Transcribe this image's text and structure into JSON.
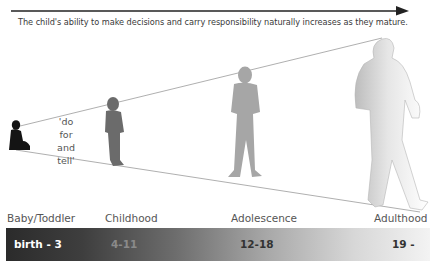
{
  "header": {
    "caption": "The child's ability to make decisions and carry responsibility naturally increases as they mature."
  },
  "diagram": {
    "quote_lines": [
      "'do for",
      "and",
      "tell'"
    ],
    "figures": [
      {
        "name": "baby",
        "color": "#141414"
      },
      {
        "name": "child",
        "color": "#6b6b6b"
      },
      {
        "name": "adolescent",
        "color": "#a6a6a6"
      },
      {
        "name": "adult",
        "color": "#e2e2e2"
      }
    ]
  },
  "stages": [
    {
      "label": "Baby/Toddler",
      "age": "birth - 3",
      "age_color": "#ffffff"
    },
    {
      "label": "Childhood",
      "age": "4-11",
      "age_color": "#8a8a8a"
    },
    {
      "label": "Adolescence",
      "age": "12-18",
      "age_color": "#333333"
    },
    {
      "label": "Adulthood",
      "age": "19 -",
      "age_color": "#333333"
    }
  ],
  "colors": {
    "arrow": "#222222",
    "cone_line": "#9a9a9a",
    "bar_dark": "#2b2b2b",
    "bar_light": "#f3f3f3"
  }
}
